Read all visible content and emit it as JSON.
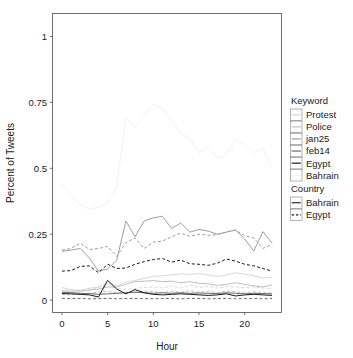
{
  "chart_data": {
    "type": "line",
    "title": "",
    "xlabel": "Hour",
    "ylabel": "Percent of Tweets",
    "xlim": [
      0,
      23
    ],
    "ylim": [
      0,
      1.04
    ],
    "xticks": [
      0,
      5,
      10,
      15,
      20
    ],
    "xticklabels": [
      "0",
      "5",
      "10",
      "15",
      "20"
    ],
    "yticks": [
      0,
      0.25,
      0.5,
      0.75,
      1
    ],
    "yticklabels": [
      "0",
      "0.25",
      "0.5",
      "0.75",
      "1"
    ],
    "grid": false,
    "legend_position": "right",
    "x": [
      0,
      1,
      2,
      3,
      4,
      5,
      6,
      7,
      8,
      9,
      10,
      11,
      12,
      13,
      14,
      15,
      16,
      17,
      18,
      19,
      20,
      21,
      22,
      23
    ],
    "series": [
      {
        "name": "Bahrain keyword / Bahrain country",
        "keyword": "Bahrain",
        "country": "Bahrain",
        "color": "#f2f2f2",
        "dash": "solid",
        "values": [
          0.443,
          0.395,
          0.362,
          0.345,
          0.352,
          0.368,
          0.43,
          0.692,
          0.655,
          0.705,
          0.742,
          0.728,
          0.68,
          0.632,
          0.612,
          0.56,
          0.58,
          0.54,
          0.55,
          0.61,
          0.59,
          0.56,
          0.575,
          0.5
        ]
      },
      {
        "name": "Bahrain keyword / Egypt country",
        "keyword": "Bahrain",
        "country": "Egypt",
        "color": "#f2f2f2",
        "dash": "dashed",
        "values": [
          0.01,
          0.009,
          0.01,
          0.008,
          0.009,
          0.011,
          0.01,
          0.009,
          0.01,
          0.008,
          0.009,
          0.01,
          0.009,
          0.008,
          0.009,
          0.01,
          0.008,
          0.009,
          0.01,
          0.009,
          0.008,
          0.009,
          0.01,
          0.009
        ]
      },
      {
        "name": "Protest keyword / Bahrain country",
        "keyword": "Protest",
        "country": "Bahrain",
        "color": "#d9d9d9",
        "dash": "solid",
        "values": [
          0.048,
          0.04,
          0.038,
          0.045,
          0.05,
          0.062,
          0.055,
          0.068,
          0.075,
          0.082,
          0.09,
          0.092,
          0.096,
          0.1,
          0.098,
          0.101,
          0.096,
          0.09,
          0.095,
          0.104,
          0.098,
          0.092,
          0.084,
          0.086
        ]
      },
      {
        "name": "Protest keyword / Egypt country",
        "keyword": "Protest",
        "country": "Egypt",
        "color": "#d9d9d9",
        "dash": "dashed",
        "values": [
          0.028,
          0.03,
          0.032,
          0.04,
          0.048,
          0.055,
          0.046,
          0.04,
          0.044,
          0.048,
          0.05,
          0.046,
          0.054,
          0.046,
          0.056,
          0.048,
          0.052,
          0.046,
          0.052,
          0.05,
          0.047,
          0.05,
          0.046,
          0.044
        ]
      },
      {
        "name": "Police keyword / Bahrain country",
        "keyword": "Police",
        "country": "Bahrain",
        "color": "#bfbfbf",
        "dash": "solid",
        "values": [
          0.036,
          0.034,
          0.035,
          0.038,
          0.042,
          0.05,
          0.05,
          0.06,
          0.07,
          0.072,
          0.074,
          0.07,
          0.072,
          0.066,
          0.07,
          0.064,
          0.062,
          0.056,
          0.06,
          0.066,
          0.06,
          0.054,
          0.05,
          0.058
        ]
      },
      {
        "name": "Police keyword / Egypt country",
        "keyword": "Police",
        "country": "Egypt",
        "color": "#bfbfbf",
        "dash": "dashed",
        "values": [
          0.022,
          0.02,
          0.024,
          0.026,
          0.03,
          0.034,
          0.028,
          0.026,
          0.03,
          0.034,
          0.032,
          0.028,
          0.034,
          0.03,
          0.036,
          0.03,
          0.034,
          0.028,
          0.034,
          0.032,
          0.028,
          0.032,
          0.028,
          0.026
        ]
      },
      {
        "name": "jan25 keyword / Bahrain country",
        "keyword": "jan25",
        "country": "Bahrain",
        "color": "#9e9e9e",
        "dash": "solid",
        "values": [
          0.185,
          0.19,
          0.196,
          0.16,
          0.11,
          0.118,
          0.152,
          0.3,
          0.24,
          0.3,
          0.312,
          0.318,
          0.272,
          0.292,
          0.258,
          0.268,
          0.262,
          0.25,
          0.258,
          0.266,
          0.232,
          0.186,
          0.26,
          0.216
        ]
      },
      {
        "name": "jan25 keyword / Egypt country",
        "keyword": "jan25",
        "country": "Egypt",
        "color": "#9e9e9e",
        "dash": "dashed",
        "values": [
          0.19,
          0.196,
          0.216,
          0.192,
          0.196,
          0.204,
          0.166,
          0.218,
          0.236,
          0.196,
          0.22,
          0.224,
          0.24,
          0.254,
          0.242,
          0.25,
          0.246,
          0.248,
          0.258,
          0.266,
          0.244,
          0.236,
          0.196,
          0.212
        ]
      },
      {
        "name": "feb14 keyword / Bahrain country",
        "keyword": "feb14",
        "country": "Bahrain",
        "color": "#6b6b6b",
        "dash": "solid",
        "values": [
          0.03,
          0.028,
          0.026,
          0.025,
          0.022,
          0.024,
          0.026,
          0.028,
          0.03,
          0.028,
          0.026,
          0.028,
          0.026,
          0.028,
          0.026,
          0.027,
          0.026,
          0.025,
          0.028,
          0.026,
          0.024,
          0.026,
          0.025,
          0.024
        ]
      },
      {
        "name": "feb14 keyword / Egypt country",
        "keyword": "feb14",
        "country": "Egypt",
        "color": "#6b6b6b",
        "dash": "dashed",
        "values": [
          0.006,
          0.006,
          0.006,
          0.005,
          0.006,
          0.006,
          0.005,
          0.006,
          0.006,
          0.006,
          0.005,
          0.006,
          0.006,
          0.005,
          0.006,
          0.006,
          0.005,
          0.006,
          0.006,
          0.005,
          0.006,
          0.006,
          0.005,
          0.006
        ]
      },
      {
        "name": "Egypt keyword / Bahrain country",
        "keyword": "Egypt",
        "country": "Bahrain",
        "color": "#1a1a1a",
        "dash": "solid",
        "values": [
          0.025,
          0.024,
          0.022,
          0.02,
          0.012,
          0.075,
          0.042,
          0.024,
          0.04,
          0.028,
          0.022,
          0.02,
          0.022,
          0.024,
          0.022,
          0.02,
          0.018,
          0.02,
          0.024,
          0.016,
          0.02,
          0.022,
          0.02,
          0.018
        ]
      },
      {
        "name": "Egypt keyword / Egypt country",
        "keyword": "Egypt",
        "country": "Egypt",
        "color": "#1a1a1a",
        "dash": "dashed",
        "values": [
          0.11,
          0.112,
          0.128,
          0.13,
          0.104,
          0.136,
          0.12,
          0.122,
          0.136,
          0.146,
          0.154,
          0.158,
          0.144,
          0.152,
          0.138,
          0.136,
          0.132,
          0.14,
          0.156,
          0.148,
          0.136,
          0.13,
          0.12,
          0.11
        ]
      }
    ]
  },
  "axes": {
    "x_title": "Hour",
    "y_title": "Percent of Tweets",
    "x_ticklabels": [
      "0",
      "5",
      "10",
      "15",
      "20"
    ],
    "y_ticklabels": [
      "0",
      "0.25",
      "0.5",
      "0.75",
      "1"
    ]
  },
  "legend": {
    "keyword": {
      "title": "Keyword",
      "items": [
        {
          "label": "Protest",
          "color": "#d9d9d9"
        },
        {
          "label": "Police",
          "color": "#bfbfbf"
        },
        {
          "label": "jan25",
          "color": "#9e9e9e"
        },
        {
          "label": "feb14",
          "color": "#6b6b6b"
        },
        {
          "label": "Egypt",
          "color": "#1a1a1a"
        },
        {
          "label": "Bahrain",
          "color": "#f2f2f2"
        }
      ]
    },
    "country": {
      "title": "Country",
      "items": [
        {
          "label": "Bahrain",
          "dash": "solid"
        },
        {
          "label": "Egypt",
          "dash": "dashed"
        }
      ]
    }
  },
  "colors": {
    "panel_border": "#4d4d4d",
    "text": "#1a1a1a",
    "background": "#ffffff"
  }
}
